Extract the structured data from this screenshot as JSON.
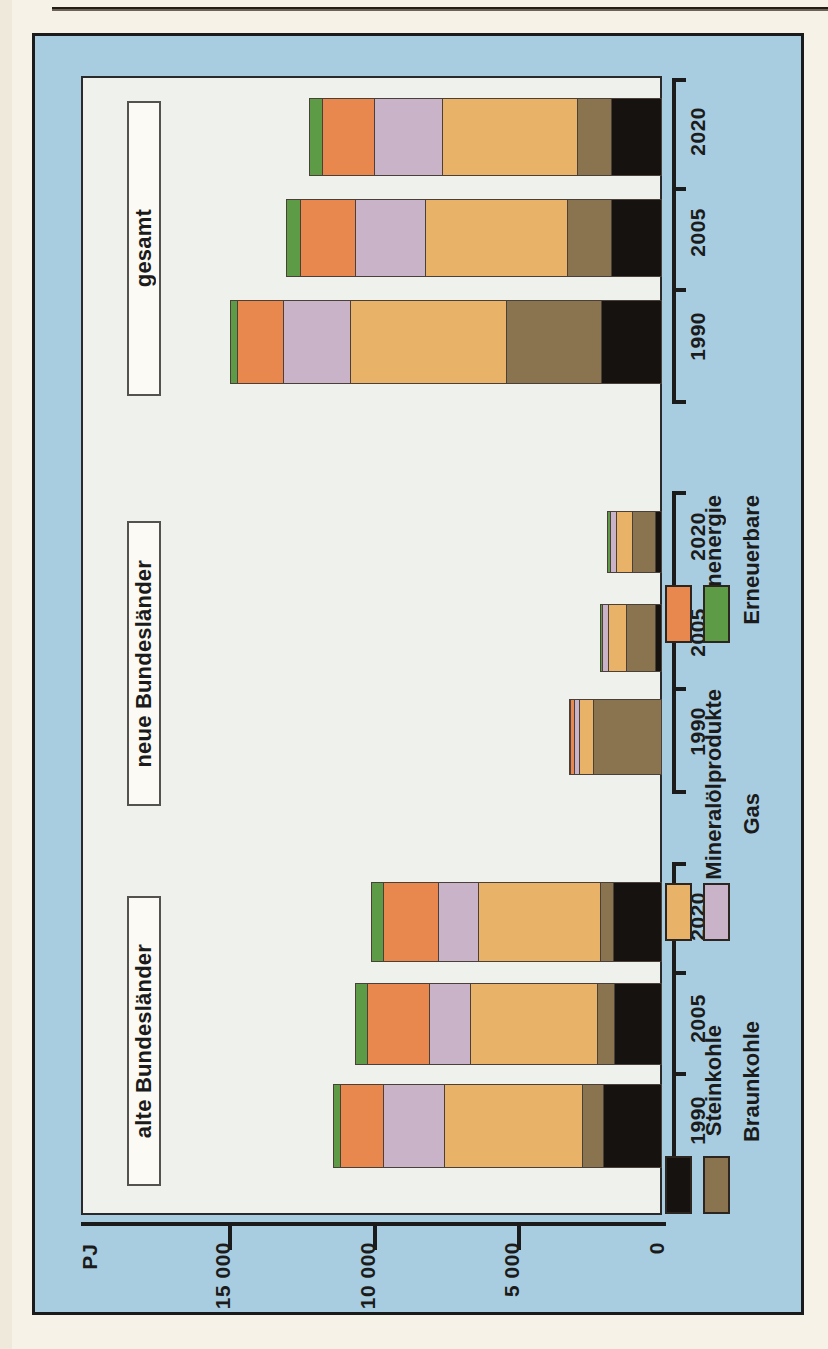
{
  "chart_data": {
    "type": "bar",
    "orientation": "horizontal-rotated",
    "title": "",
    "xlabel": "",
    "ylabel": "PJ",
    "unit": "PJ",
    "axis_unit_label": "PJ",
    "value_ticks": [
      "15 000",
      "10 000",
      "5 000",
      "0"
    ],
    "value_tick_values": [
      15000,
      10000,
      5000,
      0
    ],
    "ylim": [
      0,
      17000
    ],
    "grid": false,
    "legend_position": "right",
    "categories": [
      "1990",
      "2005",
      "2020"
    ],
    "groups": [
      "alte Bundesländer",
      "neue Bundesländer",
      "gesamt"
    ],
    "series": [
      {
        "name": "Steinkohle",
        "color": "#161210"
      },
      {
        "name": "Braunkohle",
        "color": "#8a7450"
      },
      {
        "name": "Mineralölprodukte",
        "color": "#e8b濃"
      },
      {
        "name": "Gas",
        "color": "#c9b3c9"
      },
      {
        "name": "Kernenergie",
        "color": "#e8884f"
      },
      {
        "name": "Erneuerbare",
        "color": "#5e9b46"
      }
    ],
    "series_colors": {
      "Steinkohle": "#161210",
      "Braunkohle": "#8a7450",
      "Mineralölprodukte": "#e8b368",
      "Gas": "#c9b3c9",
      "Kernenergie": "#e8884f",
      "Erneuerbare": "#5e9b46"
    },
    "data": {
      "gesamt": {
        "1990": {
          "Steinkohle": 2100,
          "Braunkohle": 3300,
          "Mineralölprodukte": 5400,
          "Gas": 2300,
          "Kernenergie": 1600,
          "Erneuerbare": 250,
          "total": 14950
        },
        "2005": {
          "Steinkohle": 1750,
          "Braunkohle": 1550,
          "Mineralölprodukte": 4900,
          "Gas": 2400,
          "Kernenergie": 1900,
          "Erneuerbare": 500,
          "total": 13000
        },
        "2020": {
          "Steinkohle": 1750,
          "Braunkohle": 1200,
          "Mineralölprodukte": 4650,
          "Gas": 2350,
          "Kernenergie": 1800,
          "Erneuerbare": 450,
          "total": 12200
        }
      },
      "neue Bundesländer": {
        "1990": {
          "Steinkohle": 0,
          "Braunkohle": 2400,
          "Mineralölprodukte": 500,
          "Gas": 150,
          "Kernenergie": 150,
          "Erneuerbare": 20,
          "total": 3220
        },
        "2005": {
          "Steinkohle": 250,
          "Braunkohle": 1000,
          "Mineralölprodukte": 600,
          "Gas": 220,
          "Kernenergie": 0,
          "Erneuerbare": 80,
          "total": 2150
        },
        "2020": {
          "Steinkohle": 250,
          "Braunkohle": 800,
          "Mineralölprodukte": 550,
          "Gas": 200,
          "Kernenergie": 0,
          "Erneuerbare": 90,
          "total": 1890
        }
      },
      "alte Bundesländer": {
        "1990": {
          "Steinkohle": 2050,
          "Braunkohle": 700,
          "Mineralölprodukte": 4800,
          "Gas": 2100,
          "Kernenergie": 1500,
          "Erneuerbare": 230,
          "total": 11380
        },
        "2005": {
          "Steinkohle": 1650,
          "Braunkohle": 600,
          "Mineralölprodukte": 4400,
          "Gas": 1400,
          "Kernenergie": 2150,
          "Erneuerbare": 420,
          "total": 10620
        },
        "2020": {
          "Steinkohle": 1700,
          "Braunkohle": 450,
          "Mineralölprodukte": 4200,
          "Gas": 1400,
          "Kernenergie": 1900,
          "Erneuerbare": 400,
          "total": 10050
        }
      }
    }
  },
  "axis": {
    "unit": "PJ",
    "ticks": [
      {
        "label": "15 000",
        "value": 15000
      },
      {
        "label": "10 000",
        "value": 10000
      },
      {
        "label": "5 000",
        "value": 5000
      },
      {
        "label": "0",
        "value": 0
      }
    ]
  },
  "groups": [
    {
      "name": "gesamt",
      "years": [
        "2020",
        "2005",
        "1990"
      ]
    },
    {
      "name": "neue Bundesländer",
      "years": [
        "2020",
        "2005",
        "1990"
      ]
    },
    {
      "name": "alte Bundesländer",
      "years": [
        "2020",
        "2005",
        "1990"
      ]
    }
  ],
  "legend": {
    "items": [
      {
        "label": "Kernenergie",
        "color": "#e8884f"
      },
      {
        "label": "Erneuerbare",
        "color": "#5e9b46"
      },
      {
        "label": "Mineralölprodukte",
        "color": "#e8b368"
      },
      {
        "label": "Gas",
        "color": "#c9b3c9"
      },
      {
        "label": "Steinkohle",
        "color": "#161210"
      },
      {
        "label": "Braunkohle",
        "color": "#8a7450"
      }
    ]
  },
  "colors": {
    "panel_background": "#a9cde0",
    "plot_background": "#eef1ec",
    "page_background": "#f6f2e8",
    "ink": "#1b1b1b"
  }
}
